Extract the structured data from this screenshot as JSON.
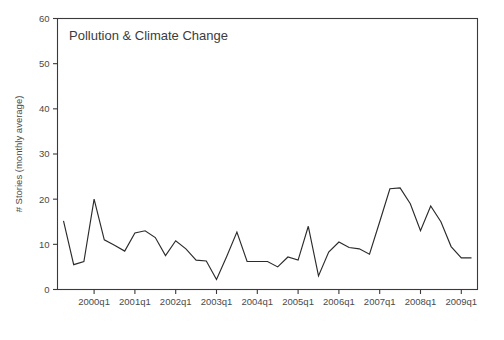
{
  "chart_data": {
    "type": "line",
    "title": "Pollution & Climate Change",
    "xlabel": "",
    "ylabel": "# Stories (monthly average)",
    "ylim": [
      0,
      60
    ],
    "yticks": [
      0,
      10,
      20,
      30,
      40,
      50,
      60
    ],
    "xticks": [
      "2000q1",
      "2001q1",
      "2002q1",
      "2003q1",
      "2004q1",
      "2005q1",
      "2006q1",
      "2007q1",
      "2008q1",
      "2009q1"
    ],
    "grid": false,
    "legend": null,
    "series_name": "# Stories (monthly average)",
    "line_color": "#2b2b2b",
    "x": [
      "1999q2",
      "1999q3",
      "1999q4",
      "2000q1",
      "2000q2",
      "2000q3",
      "2000q4",
      "2001q1",
      "2001q2",
      "2001q3",
      "2001q4",
      "2002q1",
      "2002q2",
      "2002q3",
      "2002q4",
      "2003q1",
      "2003q2",
      "2003q3",
      "2003q4",
      "2004q1",
      "2004q2",
      "2004q3",
      "2004q4",
      "2005q1",
      "2005q2",
      "2005q3",
      "2005q4",
      "2006q1",
      "2006q2",
      "2006q3",
      "2006q4",
      "2007q1",
      "2007q2",
      "2007q3",
      "2007q4",
      "2008q1",
      "2008q2",
      "2008q3",
      "2008q4",
      "2009q1",
      "2009q2"
    ],
    "values": [
      15.2,
      5.5,
      6.2,
      20.0,
      11.0,
      9.8,
      8.5,
      12.5,
      13.0,
      11.5,
      7.5,
      10.8,
      9.0,
      6.5,
      6.3,
      2.2,
      7.3,
      12.7,
      6.2,
      6.2,
      6.2,
      5.0,
      7.2,
      6.5,
      14.0,
      3.0,
      8.3,
      10.5,
      9.3,
      9.0,
      7.8,
      15.0,
      22.3,
      22.5,
      19.0,
      13.0,
      18.5,
      15.0,
      9.5,
      7.0,
      7.0
    ]
  },
  "axes": {
    "y_axis_label": "# Stories (monthly average)"
  }
}
